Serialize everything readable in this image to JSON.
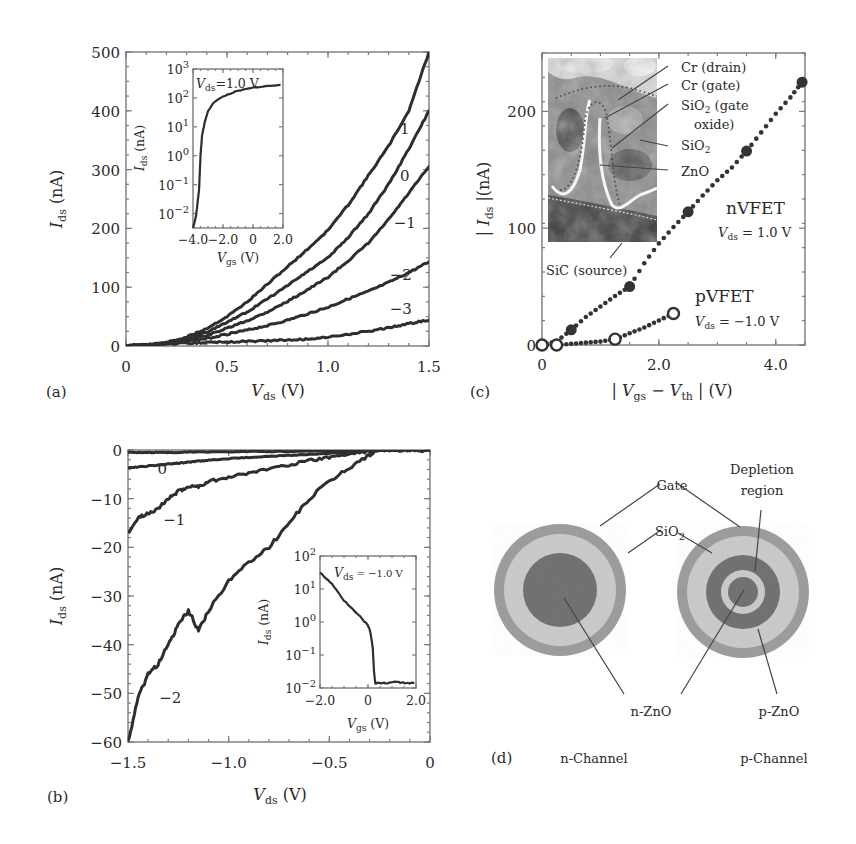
{
  "figure": {
    "panels": [
      "(a)",
      "(b)",
      "(c)",
      "(d)"
    ]
  },
  "chart_data": [
    {
      "id": "a",
      "panel_label": "(a)",
      "type": "line",
      "title": "",
      "xlabel": "V_ds (V)",
      "ylabel": "I_ds (nA)",
      "xlim": [
        0,
        1.5
      ],
      "ylim": [
        0,
        500
      ],
      "xticks": [
        "0",
        "0.5",
        "1.0",
        "1.5"
      ],
      "yticks": [
        "0",
        "100",
        "200",
        "300",
        "400",
        "500"
      ],
      "grid": false,
      "legend": "inline curve labels (V_gs in V)",
      "x": [
        0,
        0.1,
        0.2,
        0.3,
        0.4,
        0.5,
        0.6,
        0.7,
        0.8,
        0.9,
        1.0,
        1.1,
        1.2,
        1.3,
        1.4,
        1.5
      ],
      "series": [
        {
          "name": "1",
          "values": [
            0,
            2,
            6,
            15,
            30,
            50,
            75,
            105,
            135,
            165,
            197,
            240,
            290,
            340,
            400,
            500
          ]
        },
        {
          "name": "0",
          "values": [
            0,
            2,
            5,
            12,
            24,
            40,
            58,
            80,
            103,
            127,
            150,
            185,
            225,
            275,
            335,
            400
          ]
        },
        {
          "name": "-1",
          "values": [
            0,
            2,
            5,
            10,
            18,
            30,
            43,
            58,
            76,
            96,
            117,
            145,
            175,
            215,
            260,
            305
          ]
        },
        {
          "name": "-2",
          "values": [
            0,
            2,
            4,
            8,
            13,
            20,
            27,
            35,
            44,
            55,
            66,
            80,
            93,
            108,
            125,
            143
          ]
        },
        {
          "name": "-3",
          "values": [
            0,
            2,
            3,
            5,
            6,
            7,
            8,
            9,
            10,
            12,
            15,
            20,
            25,
            31,
            38,
            44
          ]
        }
      ],
      "curve_labels": [
        {
          "text": "1",
          "x": 1.38,
          "y": 360
        },
        {
          "text": "0",
          "x": 1.38,
          "y": 280
        },
        {
          "text": "−1",
          "x": 1.38,
          "y": 200
        },
        {
          "text": "−2",
          "x": 1.36,
          "y": 112
        },
        {
          "text": "−3",
          "x": 1.36,
          "y": 55
        }
      ],
      "inset": {
        "type": "line",
        "xlabel": "V_gs (V)",
        "ylabel": "I_ds (nA)",
        "annotation": "V_ds=1.0 V",
        "xlim": [
          -4.0,
          2.0
        ],
        "ylim_log10": [
          -2.5,
          3
        ],
        "xticks": [
          "−4.0",
          "−2.0",
          "0",
          "2.0"
        ],
        "yticks": [
          "10^-2",
          "10^-1",
          "10^0",
          "10^1",
          "10^2",
          "10^3"
        ],
        "x": [
          -4.0,
          -3.8,
          -3.6,
          -3.5,
          -3.4,
          -3.2,
          -3.0,
          -2.6,
          -2.0,
          -1.0,
          0,
          1.0,
          2.0
        ],
        "log10_values": [
          -2.5,
          -2.1,
          -1.2,
          0.0,
          0.7,
          1.2,
          1.55,
          1.85,
          2.05,
          2.25,
          2.35,
          2.42,
          2.45
        ]
      }
    },
    {
      "id": "b",
      "panel_label": "(b)",
      "type": "line",
      "title": "",
      "xlabel": "V_ds (V)",
      "ylabel": "I_ds (nA)",
      "xlim": [
        -1.5,
        0
      ],
      "ylim": [
        -60,
        0
      ],
      "xticks": [
        "−1.5",
        "−1.0",
        "−0.5",
        "0"
      ],
      "yticks": [
        "0",
        "−10",
        "−20",
        "−30",
        "−40",
        "−50",
        "−60"
      ],
      "grid": false,
      "x": [
        -1.5,
        -1.45,
        -1.4,
        -1.35,
        -1.3,
        -1.25,
        -1.2,
        -1.15,
        -1.1,
        -1.0,
        -0.9,
        -0.8,
        -0.7,
        -0.6,
        -0.5,
        -0.4,
        -0.3,
        -0.27,
        -0.2,
        -0.1,
        0
      ],
      "series": [
        {
          "name": "1",
          "values": [
            -0.5,
            -0.5,
            -0.5,
            -0.5,
            -0.5,
            -0.5,
            -0.4,
            -0.4,
            -0.4,
            -0.4,
            -0.3,
            -0.3,
            -0.3,
            -0.2,
            -0.2,
            -0.2,
            -0.1,
            -0.1,
            0,
            0,
            0
          ]
        },
        {
          "name": "0",
          "values": [
            -3.7,
            -3.5,
            -3.3,
            -3.1,
            -2.9,
            -2.7,
            -2.5,
            -2.3,
            -2.1,
            -1.8,
            -1.5,
            -1.3,
            -1.1,
            -0.9,
            -0.7,
            -0.5,
            -0.2,
            -0.1,
            0,
            0,
            0
          ]
        },
        {
          "name": "-1",
          "values": [
            -17,
            -14,
            -13,
            -12,
            -10,
            -8.5,
            -7.5,
            -7.5,
            -6.5,
            -5.5,
            -4.8,
            -3.8,
            -3.0,
            -2.2,
            -1.5,
            -0.8,
            -0.2,
            0,
            0,
            0,
            0
          ]
        },
        {
          "name": "-2",
          "values": [
            -60,
            -51,
            -46,
            -44,
            -40,
            -36,
            -33,
            -37,
            -33,
            -27,
            -23,
            -20,
            -15,
            -10,
            -6.5,
            -3.5,
            -1,
            0,
            0,
            0,
            0
          ]
        }
      ],
      "curve_labels": [
        {
          "text": "0",
          "x": -1.33,
          "y": -5
        },
        {
          "text": "−1",
          "x": -1.27,
          "y": -15.5
        },
        {
          "text": "−2",
          "x": -1.29,
          "y": -52
        }
      ],
      "inset": {
        "type": "line",
        "xlabel": "V_gs (V)",
        "ylabel": "I_ds (nA)",
        "annotation": "V_ds = −1.0 V",
        "xlim": [
          -2.0,
          2.0
        ],
        "ylim_log10": [
          -2,
          2
        ],
        "xticks": [
          "−2.0",
          "0",
          "2.0"
        ],
        "yticks": [
          "10^-2",
          "10^-1",
          "10^0",
          "10^1",
          "10^2"
        ],
        "x": [
          -2.0,
          -1.5,
          -1.0,
          -0.5,
          0.0,
          0.1,
          0.2,
          0.25,
          0.3,
          0.4,
          0.8,
          1.2,
          1.6,
          2.0
        ],
        "log10_values": [
          1.5,
          1.15,
          0.65,
          0.3,
          -0.1,
          -0.3,
          -0.8,
          -1.5,
          -1.85,
          -1.85,
          -1.85,
          -1.82,
          -1.85,
          -1.85
        ]
      }
    },
    {
      "id": "c",
      "panel_label": "(c)",
      "type": "scatter",
      "title": "",
      "xlabel": "|V_gs − V_th| (V)",
      "ylabel": "|I_ds| (nA)",
      "xlim": [
        0,
        4.5
      ],
      "ylim": [
        0,
        250
      ],
      "xticks": [
        "0",
        "2.0",
        "4.0"
      ],
      "yticks": [
        "0",
        "100",
        "200"
      ],
      "grid": false,
      "series": [
        {
          "name": "nVFET",
          "condition": "V_ds = 1.0 V",
          "marker": "filled-circle",
          "x": [
            0,
            0.25,
            0.5,
            0.75,
            1.0,
            1.25,
            1.5,
            1.75,
            2.0,
            2.25,
            2.5,
            2.75,
            3.0,
            3.25,
            3.5,
            3.75,
            4.0,
            4.25,
            4.45
          ],
          "y": [
            0,
            3,
            13,
            24,
            33,
            42,
            50,
            70,
            87,
            101,
            114,
            128,
            141,
            152,
            166,
            182,
            198,
            212,
            225
          ],
          "highlight_x": [
            0.5,
            1.5,
            2.5,
            3.5,
            4.45
          ]
        },
        {
          "name": "pVFET",
          "condition": "V_ds = −1.0 V",
          "marker": "open-circle",
          "x": [
            0,
            0.25,
            0.5,
            0.75,
            1.0,
            1.25,
            1.5,
            1.75,
            2.0,
            2.25
          ],
          "y": [
            0,
            0,
            1,
            2,
            3,
            5,
            10,
            15,
            21,
            27
          ],
          "highlight_x": [
            0,
            0.25,
            1.25,
            2.25
          ]
        }
      ],
      "inset_image": {
        "kind": "SEM cross-section",
        "labels": [
          "Cr (drain)",
          "Cr (gate)",
          "SiO₂ (gate",
          "oxide)",
          "SiO₂",
          "ZnO",
          "SiC (source)"
        ]
      },
      "annotations": [
        {
          "text": "nVFET",
          "sub": "V_ds = 1.0 V"
        },
        {
          "text": "pVFET",
          "sub": "V_ds = −1.0 V"
        }
      ]
    }
  ],
  "diagram_d": {
    "panel_label": "(d)",
    "labels": {
      "gate": "Gate",
      "sio2": "SiO",
      "sio2_sub": "2",
      "depletion_1": "Depletion",
      "depletion_2": "region",
      "nzno": "n-ZnO",
      "pzno": "p-ZnO",
      "n_channel": "n-Channel",
      "p_channel": "p-Channel"
    },
    "colors": {
      "gate": "#9b9b9b",
      "sio2": "#c9c9c9",
      "zno": "#6f6f6f"
    }
  },
  "text": {
    "a_xlabel_main": "V",
    "a_xlabel_sub": "ds",
    "a_xlabel_unit": " (V)",
    "ylabel_main": "I",
    "ylabel_sub": "ds",
    "ylabel_unit": " (nA)",
    "inset_xlabel_main": "V",
    "inset_xlabel_sub": "gs",
    "inset_xlabel_unit": " (V)",
    "a_inset_anno_main": "V",
    "a_inset_anno_sub": "ds",
    "a_inset_anno_val": "=1.0 V",
    "b_inset_anno_main": "V",
    "b_inset_anno_sub": "ds",
    "b_inset_anno_val": " = −1.0 V",
    "c_ylabel_pre": "| ",
    "c_ylabel_main": "I",
    "c_ylabel_sub": "ds",
    "c_ylabel_post": " |(nA)",
    "c_xlabel_pre": "| ",
    "c_xlabel_v1": "V",
    "c_xlabel_s1": "gs",
    "c_xlabel_mid": " − ",
    "c_xlabel_v2": "V",
    "c_xlabel_s2": "th",
    "c_xlabel_post": " | (V)",
    "nvfet": "nVFET",
    "pvfet": "pVFET",
    "vds": "V",
    "vds_sub": "ds",
    "nvfet_val": " = 1.0 V",
    "pvfet_val": " = −1.0 V",
    "sem_cr_drain": "Cr (drain)",
    "sem_cr_gate": "Cr (gate)",
    "sem_sio2_gate_1": "SiO",
    "sem_sio2_gate_sub": "2",
    "sem_sio2_gate_2": " (gate",
    "sem_sio2_gate_3": "oxide)",
    "sem_sio2": "SiO",
    "sem_sio2_sub": "2",
    "sem_zno": "ZnO",
    "sem_sic": "SiC (source)"
  }
}
